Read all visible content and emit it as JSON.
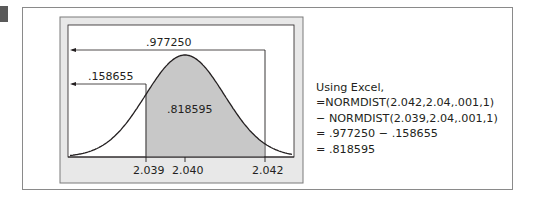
{
  "figure": {
    "labels": {
      "upper_cdf": ".977250",
      "lower_cdf": ".158655",
      "shaded_area": ".818595"
    },
    "x_ticks": [
      "2.039",
      "2.040",
      "2.042"
    ]
  },
  "excel_note": {
    "lines": [
      "Using Excel,",
      "=NORMDIST(2.042,2.04,.001,1)",
      "− NORMDIST(2.039,2.04,.001,1)",
      "= .977250 − .158655",
      "= .818595"
    ]
  },
  "colors": {
    "panel_gray": "#e6e6e6",
    "shade_gray": "#c8c8c8",
    "line": "#231f20",
    "frame": "#8a8a8a"
  },
  "chart_data": {
    "type": "area",
    "title": "",
    "distribution": {
      "mean": 2.04,
      "sd": 0.001
    },
    "x_ticks": [
      2.039,
      2.04,
      2.042
    ],
    "shaded_interval": [
      2.039,
      2.042
    ],
    "annotations": [
      {
        "text": ".977250",
        "meaning": "P(X < 2.042)"
      },
      {
        "text": ".158655",
        "meaning": "P(X < 2.039)"
      },
      {
        "text": ".818595",
        "meaning": "P(2.039 < X < 2.042)"
      }
    ],
    "xlabel": "",
    "ylabel": "",
    "grid": false
  }
}
